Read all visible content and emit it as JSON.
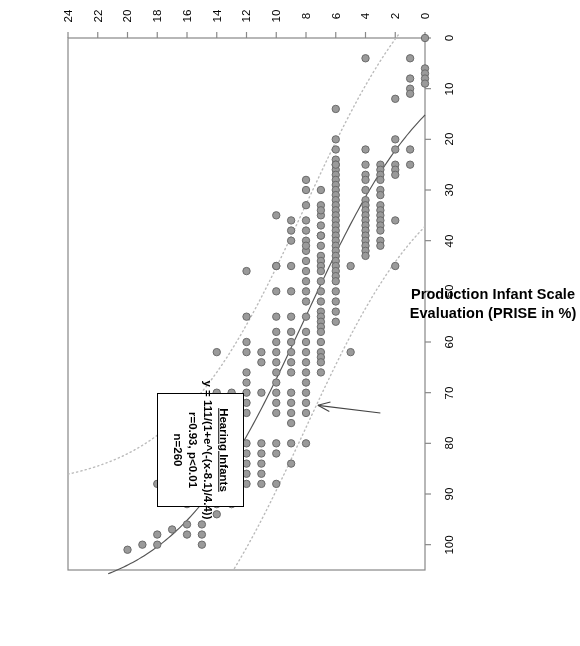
{
  "figure": {
    "orientation_degrees": 180,
    "background": "#ffffff"
  },
  "axes": {
    "x": {
      "title": "Age (in Months)",
      "ticks": [
        0,
        2,
        4,
        6,
        8,
        10,
        12,
        14,
        16,
        18,
        20,
        22,
        24
      ],
      "min": 0,
      "max": 24
    },
    "y": {
      "title_line1": "Production Infant Scale",
      "title_line2": "Evaluation (PRISE in %)",
      "title": "Production Infant Scale Evaluation (PRISE in %)",
      "ticks": [
        0,
        10,
        20,
        30,
        40,
        50,
        60,
        70,
        80,
        90,
        100
      ],
      "min": 0,
      "max": 105
    }
  },
  "annotation": {
    "title": "Hearing Infants",
    "equation": "y = 111/(1+e^(-(x-8.1)/4.4))",
    "stats": "r=0.93, p<0.01",
    "sample_size": "n=260"
  },
  "style": {
    "point_fill": "#9a9a9a",
    "point_stroke": "#6a6a6a",
    "fit_line": "#555555",
    "band_line": "#bbbbbb",
    "frame": "#888888",
    "text": "#000000"
  },
  "chart_data": {
    "type": "scatter",
    "title": "",
    "xlabel": "Age (in Months)",
    "ylabel": "Production Infant Scale Evaluation (PRISE in %)",
    "xlim": [
      0,
      24
    ],
    "ylim": [
      0,
      105
    ],
    "grid": false,
    "legend": "none",
    "n": 260,
    "fit": {
      "model": "logistic",
      "equation": "y = 111/(1+e^(-(x-8.1)/4.4))",
      "asymptote": 111,
      "x0": 8.1,
      "scale": 4.4,
      "r": 0.93,
      "p": "<0.01"
    },
    "confidence_bands": {
      "style": "dotted",
      "offset_percent": 22,
      "description": "two dotted curves parallel to the logistic fit, above and below"
    },
    "points": [
      [
        0,
        0
      ],
      [
        0,
        6
      ],
      [
        0,
        7
      ],
      [
        0,
        8
      ],
      [
        0,
        9
      ],
      [
        1,
        8
      ],
      [
        1,
        10
      ],
      [
        1,
        22
      ],
      [
        1,
        25
      ],
      [
        1,
        4
      ],
      [
        1,
        11
      ],
      [
        2,
        20
      ],
      [
        2,
        22
      ],
      [
        2,
        25
      ],
      [
        2,
        26
      ],
      [
        2,
        27
      ],
      [
        2,
        45
      ],
      [
        2,
        36
      ],
      [
        2,
        12
      ],
      [
        3,
        25
      ],
      [
        3,
        26
      ],
      [
        3,
        27
      ],
      [
        3,
        28
      ],
      [
        3,
        30
      ],
      [
        3,
        31
      ],
      [
        3,
        33
      ],
      [
        3,
        34
      ],
      [
        3,
        35
      ],
      [
        3,
        36
      ],
      [
        3,
        37
      ],
      [
        3,
        38
      ],
      [
        3,
        40
      ],
      [
        3,
        41
      ],
      [
        4,
        22
      ],
      [
        4,
        25
      ],
      [
        4,
        27
      ],
      [
        4,
        28
      ],
      [
        4,
        30
      ],
      [
        4,
        32
      ],
      [
        4,
        33
      ],
      [
        4,
        34
      ],
      [
        4,
        35
      ],
      [
        4,
        36
      ],
      [
        4,
        37
      ],
      [
        4,
        38
      ],
      [
        4,
        39
      ],
      [
        4,
        40
      ],
      [
        4,
        41
      ],
      [
        4,
        42
      ],
      [
        4,
        43
      ],
      [
        4,
        4
      ],
      [
        5,
        45
      ],
      [
        5,
        62
      ],
      [
        6,
        20
      ],
      [
        6,
        22
      ],
      [
        6,
        24
      ],
      [
        6,
        25
      ],
      [
        6,
        26
      ],
      [
        6,
        27
      ],
      [
        6,
        28
      ],
      [
        6,
        29
      ],
      [
        6,
        30
      ],
      [
        6,
        31
      ],
      [
        6,
        32
      ],
      [
        6,
        33
      ],
      [
        6,
        34
      ],
      [
        6,
        35
      ],
      [
        6,
        36
      ],
      [
        6,
        37
      ],
      [
        6,
        38
      ],
      [
        6,
        39
      ],
      [
        6,
        40
      ],
      [
        6,
        41
      ],
      [
        6,
        42
      ],
      [
        6,
        43
      ],
      [
        6,
        44
      ],
      [
        6,
        45
      ],
      [
        6,
        46
      ],
      [
        6,
        47
      ],
      [
        6,
        48
      ],
      [
        6,
        50
      ],
      [
        6,
        52
      ],
      [
        6,
        54
      ],
      [
        6,
        56
      ],
      [
        6,
        25
      ],
      [
        6,
        14
      ],
      [
        7,
        30
      ],
      [
        7,
        33
      ],
      [
        7,
        35
      ],
      [
        7,
        37
      ],
      [
        7,
        39
      ],
      [
        7,
        41
      ],
      [
        7,
        43
      ],
      [
        7,
        44
      ],
      [
        7,
        45
      ],
      [
        7,
        46
      ],
      [
        7,
        48
      ],
      [
        7,
        50
      ],
      [
        7,
        52
      ],
      [
        7,
        54
      ],
      [
        7,
        55
      ],
      [
        7,
        56
      ],
      [
        7,
        57
      ],
      [
        7,
        58
      ],
      [
        7,
        60
      ],
      [
        7,
        62
      ],
      [
        7,
        63
      ],
      [
        7,
        64
      ],
      [
        7,
        66
      ],
      [
        7,
        39
      ],
      [
        7,
        34
      ],
      [
        8,
        28
      ],
      [
        8,
        30
      ],
      [
        8,
        33
      ],
      [
        8,
        36
      ],
      [
        8,
        38
      ],
      [
        8,
        40
      ],
      [
        8,
        42
      ],
      [
        8,
        44
      ],
      [
        8,
        46
      ],
      [
        8,
        48
      ],
      [
        8,
        50
      ],
      [
        8,
        52
      ],
      [
        8,
        55
      ],
      [
        8,
        58
      ],
      [
        8,
        60
      ],
      [
        8,
        62
      ],
      [
        8,
        64
      ],
      [
        8,
        66
      ],
      [
        8,
        68
      ],
      [
        8,
        70
      ],
      [
        8,
        72
      ],
      [
        8,
        74
      ],
      [
        8,
        80
      ],
      [
        8,
        41
      ],
      [
        9,
        36
      ],
      [
        9,
        38
      ],
      [
        9,
        40
      ],
      [
        9,
        45
      ],
      [
        9,
        50
      ],
      [
        9,
        55
      ],
      [
        9,
        58
      ],
      [
        9,
        60
      ],
      [
        9,
        62
      ],
      [
        9,
        64
      ],
      [
        9,
        66
      ],
      [
        9,
        70
      ],
      [
        9,
        72
      ],
      [
        9,
        74
      ],
      [
        9,
        76
      ],
      [
        9,
        80
      ],
      [
        9,
        84
      ],
      [
        10,
        35
      ],
      [
        10,
        45
      ],
      [
        10,
        50
      ],
      [
        10,
        55
      ],
      [
        10,
        58
      ],
      [
        10,
        60
      ],
      [
        10,
        62
      ],
      [
        10,
        64
      ],
      [
        10,
        66
      ],
      [
        10,
        68
      ],
      [
        10,
        70
      ],
      [
        10,
        72
      ],
      [
        10,
        74
      ],
      [
        10,
        80
      ],
      [
        10,
        82
      ],
      [
        10,
        88
      ],
      [
        11,
        62
      ],
      [
        11,
        64
      ],
      [
        10,
        45
      ],
      [
        11,
        70
      ],
      [
        11,
        80
      ],
      [
        11,
        82
      ],
      [
        11,
        84
      ],
      [
        11,
        86
      ],
      [
        11,
        88
      ],
      [
        12,
        55
      ],
      [
        12,
        60
      ],
      [
        12,
        62
      ],
      [
        12,
        66
      ],
      [
        12,
        68
      ],
      [
        12,
        70
      ],
      [
        12,
        72
      ],
      [
        12,
        74
      ],
      [
        12,
        80
      ],
      [
        12,
        82
      ],
      [
        12,
        84
      ],
      [
        12,
        86
      ],
      [
        12,
        88
      ],
      [
        12,
        46
      ],
      [
        13,
        70
      ],
      [
        13,
        74
      ],
      [
        13,
        80
      ],
      [
        13,
        88
      ],
      [
        13,
        92
      ],
      [
        14,
        62
      ],
      [
        14,
        70
      ],
      [
        14,
        72
      ],
      [
        14,
        74
      ],
      [
        14,
        76
      ],
      [
        14,
        78
      ],
      [
        14,
        80
      ],
      [
        14,
        84
      ],
      [
        14,
        86
      ],
      [
        14,
        88
      ],
      [
        14,
        90
      ],
      [
        14,
        92
      ],
      [
        14,
        94
      ],
      [
        15,
        74
      ],
      [
        15,
        80
      ],
      [
        15,
        86
      ],
      [
        15,
        88
      ],
      [
        15,
        96
      ],
      [
        15,
        98
      ],
      [
        15,
        100
      ],
      [
        16,
        88
      ],
      [
        16,
        92
      ],
      [
        16,
        96
      ],
      [
        16,
        98
      ],
      [
        17,
        97
      ],
      [
        18,
        88
      ],
      [
        18,
        98
      ],
      [
        18,
        100
      ],
      [
        19,
        100
      ],
      [
        20,
        101
      ]
    ]
  }
}
